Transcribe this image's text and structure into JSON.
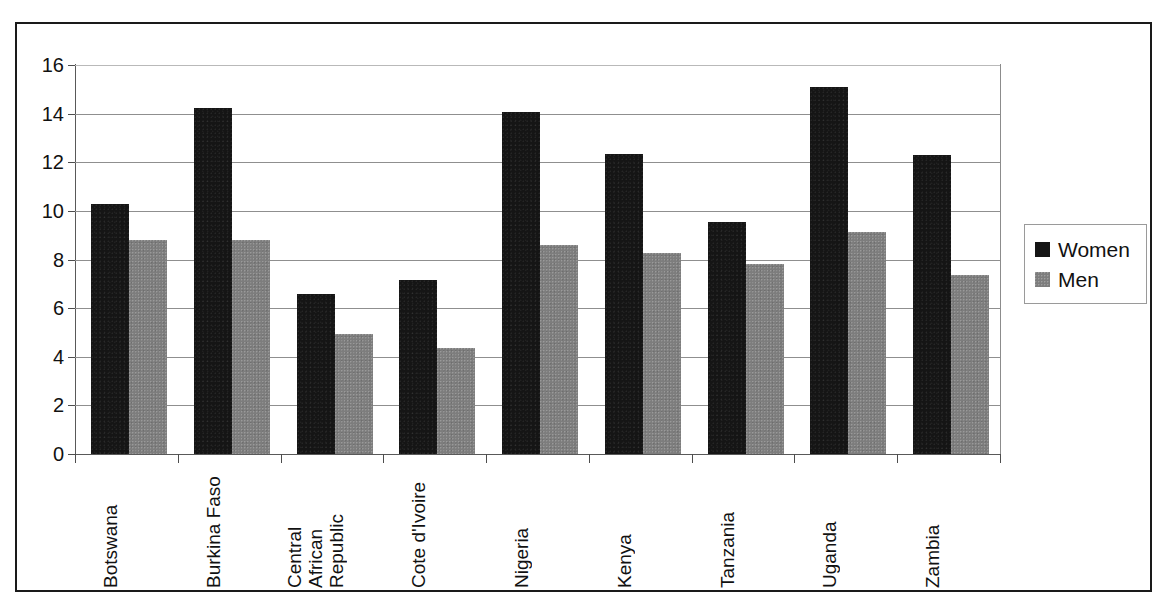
{
  "chart_data": {
    "type": "bar",
    "title": "",
    "subtitle": "",
    "xlabel": "",
    "ylabel": "",
    "ylim": [
      0,
      16
    ],
    "ytick_step": 2,
    "yticks": [
      "0",
      "2",
      "4",
      "6",
      "8",
      "10",
      "12",
      "14",
      "16"
    ],
    "grid": true,
    "grid_axis": "y",
    "legend_position": "right",
    "categories": [
      "Botswana",
      "Burkina Faso",
      "Central African Republic",
      "Cote d'Ivoire",
      "Nigeria",
      "Kenya",
      "Tanzania",
      "Uganda",
      "Zambia"
    ],
    "category_lines": [
      [
        "Botswana"
      ],
      [
        "Burkina Faso"
      ],
      [
        "Central",
        "African",
        "Republic"
      ],
      [
        "Cote d'Ivoire"
      ],
      [
        "Nigeria"
      ],
      [
        "Kenya"
      ],
      [
        "Tanzania"
      ],
      [
        "Uganda"
      ],
      [
        "Zambia"
      ]
    ],
    "series": [
      {
        "name": "Women",
        "color": "#151515",
        "values": [
          10.3,
          14.25,
          6.6,
          7.15,
          14.05,
          12.35,
          9.55,
          15.1,
          12.3
        ]
      },
      {
        "name": "Men",
        "color": "#7d7d7d",
        "values": [
          8.8,
          8.8,
          4.95,
          4.35,
          8.6,
          8.25,
          7.8,
          9.15,
          7.35
        ]
      }
    ]
  },
  "legend": {
    "items": [
      {
        "label": "Women",
        "swatch": "black-square-swatch"
      },
      {
        "label": "Men",
        "swatch": "gray-square-swatch"
      }
    ]
  }
}
